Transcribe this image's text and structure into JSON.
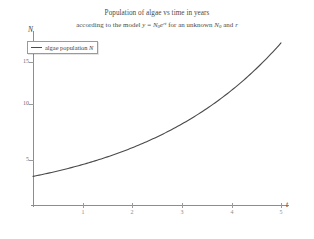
{
  "title": {
    "line1": "Population of algae vs time in years",
    "line2_pre": "according to the model ",
    "formula": {
      "y": "y",
      "eq": " = ",
      "N": "N",
      "sub0": "0",
      "e": "e",
      "exp": "rt"
    },
    "line2_post": " for an unknown ",
    "line2_N0": "N",
    "line2_N0sub": "0",
    "line2_and": " and ",
    "line2_r": "r"
  },
  "legend": {
    "icon": "line-swatch",
    "label": "algae population ",
    "label_math": "N"
  },
  "axes": {
    "y_label": "N",
    "x_label": "t",
    "y_ticks": [
      "5",
      "10",
      "15"
    ],
    "x_ticks": [
      "1",
      "2",
      "3",
      "4",
      "5"
    ]
  },
  "chart_data": {
    "type": "line",
    "xlabel": "t",
    "ylabel": "N",
    "xlim": [
      0,
      5.3
    ],
    "ylim": [
      0,
      18.5
    ],
    "xticks": [
      1,
      2,
      3,
      4,
      5
    ],
    "yticks": [
      5,
      10,
      15
    ],
    "grid": false,
    "legend_position": "top-left",
    "line_color": "#4a4a4a",
    "series": [
      {
        "name": "algae population N",
        "x": [
          0,
          0.25,
          0.5,
          0.75,
          1,
          1.25,
          1.5,
          1.75,
          2,
          2.25,
          2.5,
          2.75,
          3,
          3.25,
          3.5,
          3.75,
          4,
          4.25,
          4.5,
          4.75,
          5
        ],
        "y": [
          3.0,
          3.15,
          3.3,
          3.47,
          3.64,
          3.82,
          4.01,
          4.21,
          4.42,
          4.64,
          4.87,
          5.12,
          5.37,
          5.64,
          5.92,
          6.21,
          6.52,
          6.85,
          7.19,
          7.55,
          7.92
        ]
      }
    ],
    "model": "y = N0 * e^(r t)",
    "fitted_start_value": 3.0,
    "fitted_end_value": 17.0
  }
}
